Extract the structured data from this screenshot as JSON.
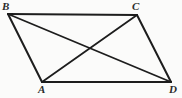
{
  "figure": {
    "shape_type": "parallelogram",
    "background_color": "#fbfbfa",
    "stroke_color": "#1d1d1d",
    "label_color": "#2b2b2b",
    "canvas": {
      "width": 182,
      "height": 98
    },
    "vertices": [
      {
        "id": "B",
        "label": "B",
        "x": 8,
        "y": 14,
        "label_x": 2,
        "label_y": 1
      },
      {
        "id": "C",
        "label": "C",
        "x": 137,
        "y": 15,
        "label_x": 132,
        "label_y": 1
      },
      {
        "id": "A",
        "label": "A",
        "x": 42,
        "y": 82,
        "label_x": 38,
        "label_y": 84
      },
      {
        "id": "D",
        "label": "D",
        "x": 171,
        "y": 82,
        "label_x": 169,
        "label_y": 84
      }
    ],
    "sides": [
      {
        "name": "BC",
        "from": "B",
        "to": "C",
        "width": 2.2
      },
      {
        "name": "CD",
        "from": "C",
        "to": "D",
        "width": 2.0
      },
      {
        "name": "AD",
        "from": "A",
        "to": "D",
        "width": 2.2
      },
      {
        "name": "BA",
        "from": "B",
        "to": "A",
        "width": 2.0
      }
    ],
    "diagonals": [
      {
        "name": "BD",
        "from": "B",
        "to": "D",
        "width": 1.8
      },
      {
        "name": "AC",
        "from": "A",
        "to": "C",
        "width": 1.8
      }
    ],
    "intersection": {
      "name": "diagonal-intersection",
      "x": 89,
      "y": 48
    }
  }
}
